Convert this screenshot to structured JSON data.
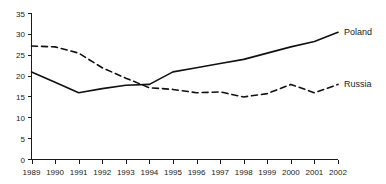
{
  "chart_data": {
    "type": "line",
    "title": "",
    "xlabel": "",
    "ylabel": "",
    "categories": [
      "1989",
      "1990",
      "1991",
      "1992",
      "1993",
      "1994",
      "1995",
      "1996",
      "1997",
      "1998",
      "1999",
      "2000",
      "2001",
      "2002"
    ],
    "x": [
      1989,
      1990,
      1991,
      1992,
      1993,
      1994,
      1995,
      1996,
      1997,
      1998,
      1999,
      2000,
      2001,
      2002
    ],
    "series": [
      {
        "name": "Poland",
        "style": "solid",
        "color": "#111111",
        "values": [
          21.0,
          18.5,
          16.0,
          17.0,
          17.8,
          18.0,
          21.0,
          22.0,
          23.0,
          24.0,
          25.5,
          27.0,
          28.3,
          30.5
        ]
      },
      {
        "name": "Russia",
        "style": "dashed",
        "color": "#111111",
        "values": [
          27.2,
          27.0,
          25.5,
          22.0,
          19.5,
          17.2,
          16.8,
          16.0,
          16.2,
          15.0,
          15.8,
          18.0,
          16.0,
          18.0
        ]
      }
    ],
    "ylim": [
      0,
      35
    ],
    "yticks": [
      0,
      5,
      10,
      15,
      20,
      25,
      30,
      35
    ],
    "ytick_labels": [
      "0",
      "5",
      "10",
      "15",
      "20",
      "25",
      "30",
      "35"
    ],
    "xlim": [
      1989,
      2002
    ],
    "grid": false,
    "legend_position": "right-inline",
    "legend": [
      {
        "label": "Poland",
        "style": "solid"
      },
      {
        "label": "Russia",
        "style": "dashed"
      }
    ]
  }
}
